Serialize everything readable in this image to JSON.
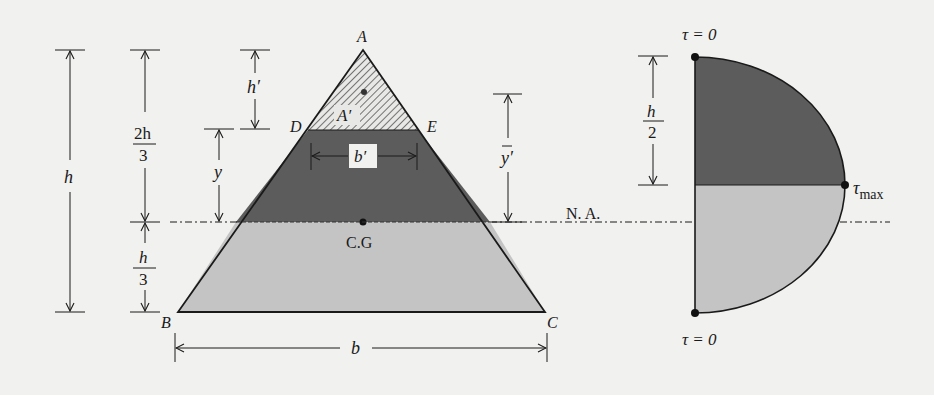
{
  "figure": {
    "type": "shear stress distribution in triangular cross-section",
    "colors": {
      "background": "#f1f1ef",
      "dark_region": "#5c5c5c",
      "light_region": "#c4c4c4",
      "line": "#1a1a1a",
      "hatch": "#555555"
    }
  },
  "triangle": {
    "vertices": {
      "A": "A",
      "B": "B",
      "C": "C",
      "D": "D",
      "E": "E"
    },
    "area_label": "A′",
    "width_label": "b′",
    "base_label": "b",
    "centroid_label": "C.G",
    "neutral_axis_label": "N. A."
  },
  "dimensions": {
    "h": "h",
    "two_h_over_3": {
      "num": "2h",
      "den": "3"
    },
    "h_over_3": {
      "num": "h",
      "den": "3"
    },
    "h_prime": "h′",
    "y": "y",
    "y_bar_prime": "y′"
  },
  "stress_diagram": {
    "top_label": "τ = 0",
    "bottom_label": "τ = 0",
    "max_label": "τ",
    "max_subscript": "max",
    "half_height": {
      "num": "h",
      "den": "2"
    }
  }
}
